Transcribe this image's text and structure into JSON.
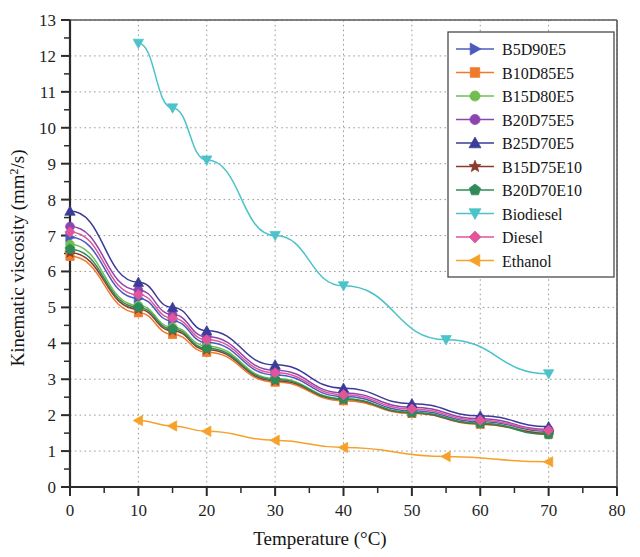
{
  "chart_data": {
    "type": "line",
    "title": "",
    "xlabel": "Temperature (°C)",
    "ylabel": "Kinematic viscosity (mm²/s)",
    "ylabel_parts": {
      "main": "Kinematic viscosity (mm",
      "sup": "2",
      "tail": "/s)"
    },
    "xlim": [
      0,
      80
    ],
    "ylim": [
      0,
      13
    ],
    "xticks": [
      0,
      10,
      20,
      30,
      40,
      50,
      60,
      70,
      80
    ],
    "yticks": [
      0,
      1,
      2,
      3,
      4,
      5,
      6,
      7,
      8,
      9,
      10,
      11,
      12,
      13
    ],
    "x_minor_step": 5,
    "y_minor_step": 0.5,
    "grid": "dotted-gray-both-axes",
    "legend_position": "top-right-inside",
    "series": [
      {
        "name": "B5D90E5",
        "color": "#4A5BC0",
        "marker": "triangle-right",
        "x": [
          0,
          10,
          15,
          20,
          30,
          40,
          50,
          60,
          70
        ],
        "values": [
          6.95,
          5.25,
          4.62,
          4.02,
          3.12,
          2.52,
          2.12,
          1.82,
          1.55
        ]
      },
      {
        "name": "B10D85E5",
        "color": "#F07A2B",
        "marker": "square",
        "x": [
          0,
          10,
          15,
          20,
          30,
          40,
          50,
          60,
          70
        ],
        "values": [
          6.42,
          4.85,
          4.25,
          3.75,
          2.92,
          2.4,
          2.05,
          1.75,
          1.48
        ]
      },
      {
        "name": "B15D80E5",
        "color": "#72BD52",
        "marker": "circle",
        "x": [
          0,
          10,
          15,
          20,
          30,
          40,
          50,
          60,
          70
        ],
        "values": [
          6.75,
          5.05,
          4.45,
          3.92,
          3.02,
          2.46,
          2.08,
          1.78,
          1.5
        ]
      },
      {
        "name": "B20D75E5",
        "color": "#8E44AD",
        "marker": "circle",
        "x": [
          0,
          10,
          15,
          20,
          30,
          40,
          50,
          60,
          70
        ],
        "values": [
          7.25,
          5.48,
          4.8,
          4.18,
          3.25,
          2.62,
          2.22,
          1.9,
          1.6
        ]
      },
      {
        "name": "B25D70E5",
        "color": "#3B3B98",
        "marker": "triangle-up",
        "x": [
          0,
          10,
          15,
          20,
          30,
          40,
          50,
          60,
          70
        ],
        "values": [
          7.68,
          5.7,
          5.0,
          4.35,
          3.4,
          2.75,
          2.32,
          1.98,
          1.68
        ]
      },
      {
        "name": "B15D75E10",
        "color": "#8B3A2E",
        "marker": "star",
        "x": [
          0,
          10,
          15,
          20,
          30,
          40,
          50,
          60,
          70
        ],
        "values": [
          6.52,
          4.95,
          4.35,
          3.82,
          2.96,
          2.44,
          2.06,
          1.76,
          1.49
        ]
      },
      {
        "name": "B20D70E10",
        "color": "#2E8B57",
        "marker": "pentagon",
        "x": [
          0,
          10,
          15,
          20,
          30,
          40,
          50,
          60,
          70
        ],
        "values": [
          6.62,
          5.0,
          4.4,
          3.86,
          2.99,
          2.45,
          2.07,
          1.77,
          1.46
        ]
      },
      {
        "name": "Biodiesel",
        "color": "#4BC3C9",
        "marker": "triangle-down",
        "x": [
          10,
          15,
          20,
          30,
          40,
          55,
          70
        ],
        "values": [
          12.35,
          10.55,
          9.1,
          7.0,
          5.6,
          4.1,
          3.15
        ]
      },
      {
        "name": "Diesel",
        "color": "#E0559B",
        "marker": "diamond",
        "x": [
          0,
          10,
          15,
          20,
          30,
          40,
          50,
          60,
          70
        ],
        "values": [
          7.1,
          5.35,
          4.7,
          4.1,
          3.18,
          2.57,
          2.17,
          1.86,
          1.58
        ]
      },
      {
        "name": "Ethanol",
        "color": "#F5A22B",
        "marker": "triangle-left",
        "x": [
          10,
          15,
          20,
          30,
          40,
          55,
          70
        ],
        "values": [
          1.85,
          1.7,
          1.55,
          1.3,
          1.1,
          0.85,
          0.7
        ]
      }
    ]
  }
}
